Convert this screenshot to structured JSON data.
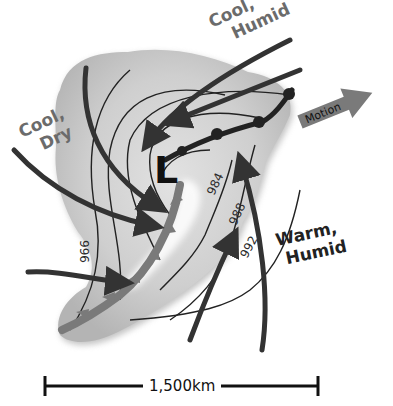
{
  "diagram": {
    "type": "mid-latitude cyclone weather map",
    "low_pressure_symbol": "L",
    "air_masses": [
      {
        "id": "nw",
        "line1": "Cool,",
        "line2": "Dry",
        "color": "#6b6b6b"
      },
      {
        "id": "ne",
        "line1": "Cool,",
        "line2": "Humid",
        "color": "#6b6b6b"
      },
      {
        "id": "se",
        "line1": "Warm,",
        "line2": "Humid",
        "color": "#222222"
      }
    ],
    "isobars": [
      {
        "label": "984"
      },
      {
        "label": "988"
      },
      {
        "label": "992"
      },
      {
        "label": "996"
      }
    ],
    "motion_arrow": {
      "label": "Motion",
      "color": "#7a7a7a"
    },
    "fronts": [
      {
        "type": "warm front",
        "symbol": "semicircles"
      },
      {
        "type": "cold front",
        "symbol": "triangles"
      }
    ],
    "scale_bar": {
      "label": "1,500km"
    },
    "colors": {
      "cloud": "#c8c8c8",
      "front": "#777777",
      "wind": "#333333",
      "isobar": "#222222"
    }
  }
}
